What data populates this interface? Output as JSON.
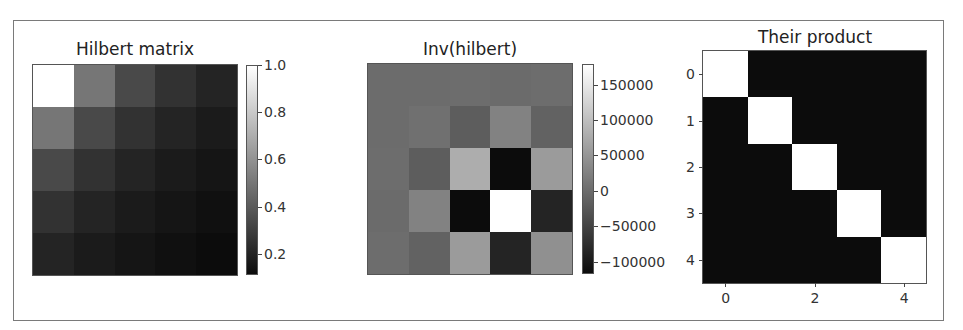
{
  "chart_data": [
    {
      "type": "heatmap",
      "title": "Hilbert matrix",
      "colormap": "gray",
      "rows": 5,
      "cols": 5,
      "values": [
        [
          1.0,
          0.5,
          0.3333,
          0.25,
          0.2
        ],
        [
          0.5,
          0.3333,
          0.25,
          0.2,
          0.1667
        ],
        [
          0.3333,
          0.25,
          0.2,
          0.1667,
          0.1429
        ],
        [
          0.25,
          0.2,
          0.1667,
          0.1429,
          0.125
        ],
        [
          0.2,
          0.1667,
          0.1429,
          0.125,
          0.1111
        ]
      ],
      "vmin": 0.1111,
      "vmax": 1.0,
      "axes_visible": false,
      "colorbar": {
        "ticks": [
          1.0,
          0.8,
          0.6,
          0.4,
          0.2
        ],
        "tick_labels": [
          "1.0",
          "0.8",
          "0.6",
          "0.4",
          "0.2"
        ]
      }
    },
    {
      "type": "heatmap",
      "title": "Inv(hilbert)",
      "colormap": "gray",
      "rows": 5,
      "cols": 5,
      "values": [
        [
          25,
          -300,
          1050,
          -1400,
          630
        ],
        [
          -300,
          4800,
          -18900,
          26880,
          -12600
        ],
        [
          1050,
          -18900,
          79380,
          -117600,
          56700
        ],
        [
          -1400,
          26880,
          -117600,
          179200,
          -88200
        ],
        [
          630,
          -12600,
          56700,
          -88200,
          44100
        ]
      ],
      "vmin": -117600,
      "vmax": 179200,
      "axes_visible": false,
      "colorbar": {
        "ticks": [
          150000,
          100000,
          50000,
          0,
          -50000,
          -100000
        ],
        "tick_labels": [
          "150000",
          "100000",
          "50000",
          "0",
          "−50000",
          "−100000"
        ]
      }
    },
    {
      "type": "heatmap",
      "title": "Their product",
      "colormap": "gray",
      "rows": 5,
      "cols": 5,
      "values": [
        [
          1,
          0,
          0,
          0,
          0
        ],
        [
          0,
          1,
          0,
          0,
          0
        ],
        [
          0,
          0,
          1,
          0,
          0
        ],
        [
          0,
          0,
          0,
          1,
          0
        ],
        [
          0,
          0,
          0,
          0,
          1
        ]
      ],
      "vmin": 0,
      "vmax": 1,
      "axes_visible": true,
      "xticks": [
        0,
        2,
        4
      ],
      "xtick_labels": [
        "0",
        "2",
        "4"
      ],
      "yticks": [
        0,
        1,
        2,
        3,
        4
      ],
      "ytick_labels": [
        "0",
        "1",
        "2",
        "3",
        "4"
      ]
    }
  ]
}
